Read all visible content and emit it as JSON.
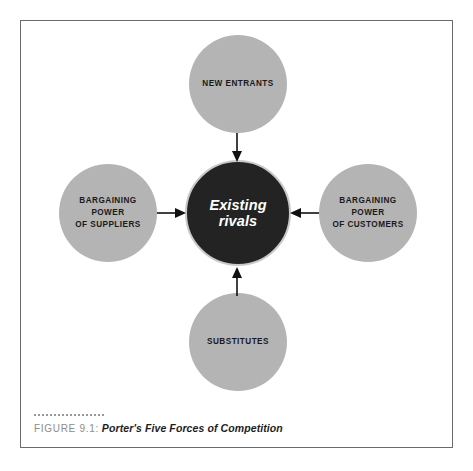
{
  "figure": {
    "caption_prefix": "FIGURE 9.1:",
    "caption_title": "Porter's Five Forces of Competition"
  },
  "diagram": {
    "type": "porters-five-forces",
    "center": {
      "id": "existing-rivals",
      "label": "Existing\nrivals",
      "fill": "#232323",
      "text_color": "#ffffff"
    },
    "forces": [
      {
        "id": "new-entrants",
        "label": "NEW ENTRANTS",
        "position": "top",
        "fill": "#b4b4b4",
        "text_color": "#1a1a1a"
      },
      {
        "id": "bargaining-power-of-suppliers",
        "label": "BARGAINING\nPOWER\nOF SUPPLIERS",
        "position": "left",
        "fill": "#b4b4b4",
        "text_color": "#1a1a1a"
      },
      {
        "id": "bargaining-power-of-customers",
        "label": "BARGAINING\nPOWER\nOF CUSTOMERS",
        "position": "right",
        "fill": "#b4b4b4",
        "text_color": "#1a1a1a"
      },
      {
        "id": "substitutes",
        "label": "SUBSTITUTES",
        "position": "bottom",
        "fill": "#b4b4b4",
        "text_color": "#1a1a1a"
      }
    ],
    "arrows": [
      {
        "id": "arrow-new-entrants-to-center",
        "direction": "down",
        "from": "new-entrants",
        "to": "existing-rivals"
      },
      {
        "id": "arrow-substitutes-to-center",
        "direction": "up",
        "from": "substitutes",
        "to": "existing-rivals"
      },
      {
        "id": "arrow-suppliers-to-center",
        "direction": "right",
        "from": "bargaining-power-of-suppliers",
        "to": "existing-rivals"
      },
      {
        "id": "arrow-customers-to-center",
        "direction": "left",
        "from": "bargaining-power-of-customers",
        "to": "existing-rivals"
      }
    ]
  },
  "colors": {
    "frame_border": "#6b6b6b",
    "node_gray": "#b4b4b4",
    "node_dark": "#232323",
    "arrow": "#111111",
    "caption_prefix": "#8c8c8c",
    "background": "#ffffff"
  }
}
